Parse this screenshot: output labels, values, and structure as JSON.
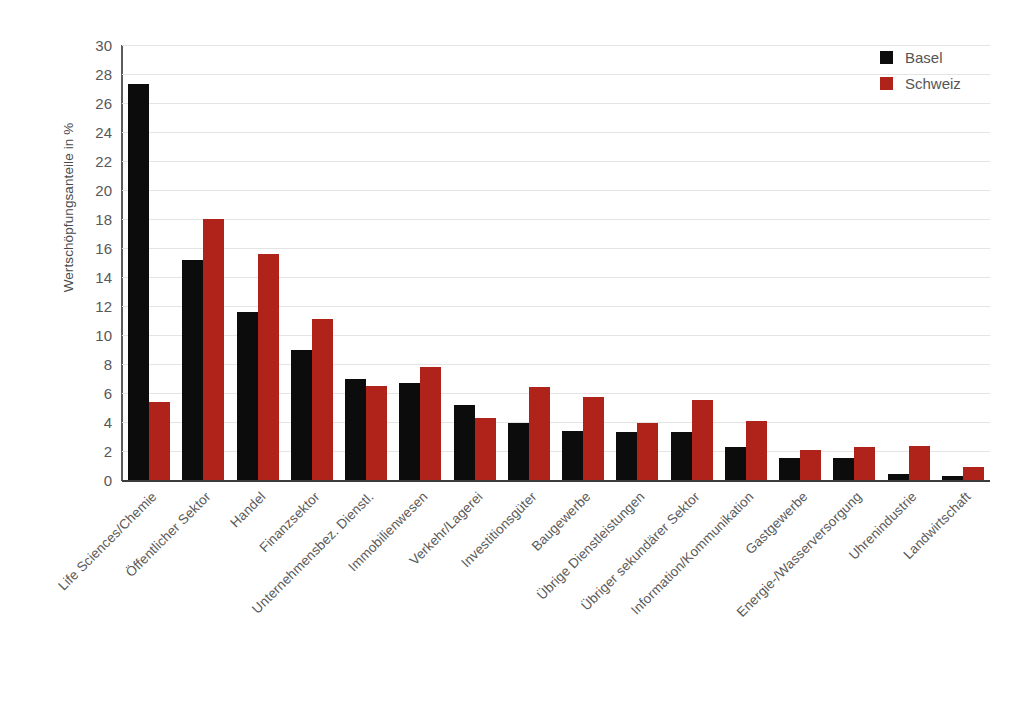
{
  "chart_data": {
    "type": "bar",
    "title": "",
    "xlabel": "",
    "ylabel": "Wertschöpfungsanteile in %",
    "ylim": [
      0,
      30
    ],
    "ytick_step": 2,
    "yticks": [
      30,
      28,
      26,
      24,
      22,
      20,
      18,
      16,
      14,
      12,
      10,
      8,
      6,
      4,
      2,
      0
    ],
    "grid": true,
    "legend_position": "top-right",
    "categories": [
      "Life Sciences/Chemie",
      "Öffentlicher Sektor",
      "Handel",
      "Finanzsektor",
      "Unternehmensbez. Dienstl.",
      "Immobilienwesen",
      "Verkehr/Lagerei",
      "Investitionsgüter",
      "Baugewerbe",
      "Übrige Dienstleistungen",
      "Übriger sekundärer Sektor",
      "Information/Kommunikation",
      "Gastgewerbe",
      "Energie-/Wasserversorgung",
      "Uhrenindustrie",
      "Landwirtschaft"
    ],
    "series": [
      {
        "name": "Basel",
        "color": "#0d0c0c",
        "values": [
          27.3,
          15.2,
          11.6,
          9.0,
          7.0,
          6.7,
          5.2,
          3.9,
          3.4,
          3.3,
          3.3,
          2.3,
          1.5,
          1.5,
          0.4,
          0.25
        ]
      },
      {
        "name": "Schweiz",
        "color": "#b0231a",
        "values": [
          5.4,
          18.0,
          15.6,
          11.1,
          6.5,
          7.8,
          4.3,
          6.4,
          5.7,
          3.9,
          5.5,
          4.1,
          2.1,
          2.25,
          2.35,
          0.9
        ]
      }
    ]
  },
  "legend": {
    "items": [
      {
        "label": "Basel",
        "color": "#0d0c0c"
      },
      {
        "label": "Schweiz",
        "color": "#b0231a"
      }
    ]
  },
  "colors": {
    "basel": "#0d0c0c",
    "schweiz": "#b0231a",
    "gridline": "#e4e4e4",
    "axis": "#5c5c5c",
    "text": "#585858",
    "background": "#ffffff"
  }
}
